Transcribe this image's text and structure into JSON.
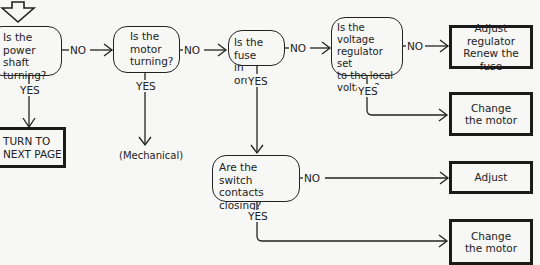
{
  "diagram": {
    "type": "troubleshooting-flowchart",
    "decisions": [
      {
        "id": "d1",
        "text": "Is the power\nshaft\nturning?"
      },
      {
        "id": "d2",
        "text": "Is the\nmotor\nturning?"
      },
      {
        "id": "d3",
        "text": "Is the fuse\nin order?"
      },
      {
        "id": "d4",
        "text": "Is the voltage\nregulator set\nto the local\nvoltage?"
      },
      {
        "id": "d5",
        "text": "Are the\nswitch contacts\nclosing?"
      }
    ],
    "actions": [
      {
        "id": "a1",
        "text": "TURN TO\nNEXT PAGE"
      },
      {
        "id": "a2",
        "text": "Adjust regulator\nRenew the fuse"
      },
      {
        "id": "a3",
        "text": "Change\nthe motor"
      },
      {
        "id": "a4",
        "text": "Adjust"
      },
      {
        "id": "a5",
        "text": "Change\nthe motor"
      }
    ],
    "terminal_notes": [
      {
        "id": "n1",
        "text": "(Mechanical)"
      }
    ],
    "edge_labels": {
      "no": "NO",
      "yes": "YES"
    },
    "edges": [
      {
        "from": "start",
        "to": "d1",
        "label": ""
      },
      {
        "from": "d1",
        "to": "d2",
        "label": "NO"
      },
      {
        "from": "d1",
        "to": "a1",
        "label": "YES"
      },
      {
        "from": "d2",
        "to": "d3",
        "label": "NO"
      },
      {
        "from": "d2",
        "to": "n1",
        "label": "YES"
      },
      {
        "from": "d3",
        "to": "d4",
        "label": "NO"
      },
      {
        "from": "d3",
        "to": "d5",
        "label": "YES"
      },
      {
        "from": "d4",
        "to": "a2",
        "label": "NO"
      },
      {
        "from": "d4",
        "to": "a3",
        "label": "YES"
      },
      {
        "from": "d5",
        "to": "a4",
        "label": "NO"
      },
      {
        "from": "d5",
        "to": "a5",
        "label": "YES"
      }
    ]
  }
}
